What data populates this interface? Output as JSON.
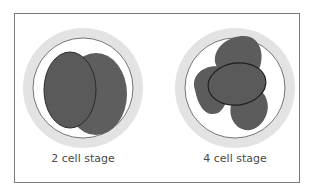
{
  "figure": {
    "panels": [
      {
        "id": "two-cell",
        "label": "2 cell stage",
        "cells": 2
      },
      {
        "id": "four-cell",
        "label": "4 cell stage",
        "cells": 4
      }
    ],
    "colors": {
      "frame": "#7a7a7a",
      "zona_pellucida": "#e2e2e2",
      "membrane": "#ffffff",
      "cell_fill": "#5a5a5a",
      "cell_outline": "#2a2a2a",
      "label": "#4a4a4a"
    }
  }
}
